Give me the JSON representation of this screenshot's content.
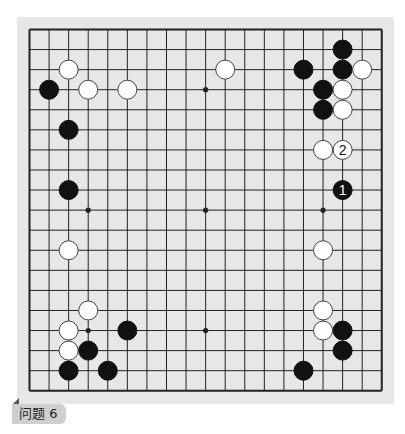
{
  "board": {
    "size": 19,
    "grid_left": 29.5,
    "grid_top": 29.5,
    "spacing_x": 19.57,
    "spacing_y": 20.07,
    "stone_radius": 9.5,
    "colors": {
      "board_bg": "#e7e7e7",
      "line": "#222222",
      "black_stone": "#111111",
      "white_stone": "#ffffff",
      "white_stone_edge": "#444444"
    },
    "star_points": [
      {
        "col": 9,
        "row": 3
      },
      {
        "col": 3,
        "row": 9
      },
      {
        "col": 9,
        "row": 9
      },
      {
        "col": 15,
        "row": 9
      },
      {
        "col": 3,
        "row": 15
      },
      {
        "col": 9,
        "row": 15
      }
    ],
    "stones": [
      {
        "color": "white",
        "col": 2,
        "row": 2
      },
      {
        "color": "black",
        "col": 1,
        "row": 3
      },
      {
        "color": "white",
        "col": 3,
        "row": 3
      },
      {
        "color": "white",
        "col": 5,
        "row": 3
      },
      {
        "color": "black",
        "col": 2,
        "row": 5
      },
      {
        "color": "black",
        "col": 2,
        "row": 8
      },
      {
        "color": "white",
        "col": 2,
        "row": 11
      },
      {
        "color": "white",
        "col": 10,
        "row": 2
      },
      {
        "color": "black",
        "col": 14,
        "row": 2
      },
      {
        "color": "black",
        "col": 16,
        "row": 1
      },
      {
        "color": "black",
        "col": 16,
        "row": 2
      },
      {
        "color": "white",
        "col": 17,
        "row": 2
      },
      {
        "color": "black",
        "col": 15,
        "row": 3
      },
      {
        "color": "white",
        "col": 16,
        "row": 3
      },
      {
        "color": "black",
        "col": 15,
        "row": 4
      },
      {
        "color": "white",
        "col": 16,
        "row": 4
      },
      {
        "color": "white",
        "col": 15,
        "row": 6
      },
      {
        "color": "white",
        "col": 16,
        "row": 6,
        "number": "2"
      },
      {
        "color": "black",
        "col": 16,
        "row": 8,
        "number": "1"
      },
      {
        "color": "white",
        "col": 15,
        "row": 11
      },
      {
        "color": "white",
        "col": 15,
        "row": 14
      },
      {
        "color": "white",
        "col": 15,
        "row": 15
      },
      {
        "color": "black",
        "col": 16,
        "row": 15
      },
      {
        "color": "black",
        "col": 16,
        "row": 16
      },
      {
        "color": "black",
        "col": 14,
        "row": 17
      },
      {
        "color": "white",
        "col": 3,
        "row": 14
      },
      {
        "color": "white",
        "col": 2,
        "row": 15
      },
      {
        "color": "black",
        "col": 5,
        "row": 15
      },
      {
        "color": "white",
        "col": 2,
        "row": 16
      },
      {
        "color": "black",
        "col": 3,
        "row": 16
      },
      {
        "color": "black",
        "col": 2,
        "row": 17
      },
      {
        "color": "black",
        "col": 4,
        "row": 17
      }
    ]
  },
  "label": {
    "text": "问题 6"
  }
}
